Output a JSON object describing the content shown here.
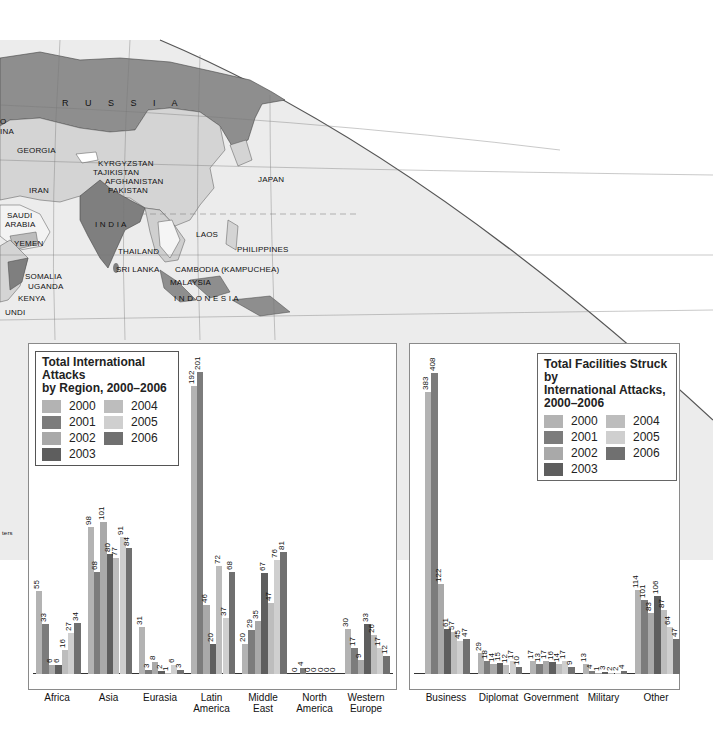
{
  "colors": {
    "2000": "#b3b3b3",
    "2001": "#7c7c7c",
    "2002": "#a9a9a9",
    "2003": "#5e5e5e",
    "2004": "#bdbdbd",
    "2005": "#cfcfcf",
    "2006": "#707070",
    "map_highlight": "#8e8e8e",
    "map_land": "#d7d7d7",
    "map_water": "#ececec"
  },
  "map": {
    "labels": [
      {
        "text": "R U S S I A",
        "x": 62,
        "y": 98,
        "big": true
      },
      {
        "text": "GEORGIA",
        "x": 17,
        "y": 146
      },
      {
        "text": "KYRGYZSTAN",
        "x": 98,
        "y": 159
      },
      {
        "text": "TAJIKISTAN",
        "x": 93,
        "y": 168
      },
      {
        "text": "AFGHANISTAN",
        "x": 105,
        "y": 177
      },
      {
        "text": "PAKISTAN",
        "x": 108,
        "y": 186
      },
      {
        "text": "IRAN",
        "x": 29,
        "y": 186
      },
      {
        "text": "JAPAN",
        "x": 258,
        "y": 175
      },
      {
        "text": "SAUDI",
        "x": 7,
        "y": 211
      },
      {
        "text": "ARABIA",
        "x": 5,
        "y": 220
      },
      {
        "text": "I N D I A",
        "x": 95,
        "y": 220
      },
      {
        "text": "YEMEN",
        "x": 14,
        "y": 239
      },
      {
        "text": "LAOS",
        "x": 196,
        "y": 230
      },
      {
        "text": "THAILAND",
        "x": 118,
        "y": 247
      },
      {
        "text": "PHILIPPINES",
        "x": 237,
        "y": 245
      },
      {
        "text": "SRI LANKA",
        "x": 116,
        "y": 265
      },
      {
        "text": "CAMBODIA (KAMPUCHEA)",
        "x": 175,
        "y": 265
      },
      {
        "text": "SOMALIA",
        "x": 25,
        "y": 272
      },
      {
        "text": "UGANDA",
        "x": 28,
        "y": 282
      },
      {
        "text": "MALAYSIA",
        "x": 170,
        "y": 278
      },
      {
        "text": "KENYA",
        "x": 18,
        "y": 294
      },
      {
        "text": "I N D O N E S I A",
        "x": 174,
        "y": 294
      },
      {
        "text": "UNDI",
        "x": 5,
        "y": 308
      },
      {
        "text": "O",
        "x": 0,
        "y": 117
      },
      {
        "text": "INA",
        "x": 0,
        "y": 127
      }
    ],
    "partial_label": "ters"
  },
  "chart_data": [
    {
      "type": "bar",
      "title": "Total International Attacks by Region, 2000–2006",
      "title_lines": [
        "Total International Attacks",
        "by Region, 2000–2006"
      ],
      "categories": [
        "Africa",
        "Asia",
        "Eurasia",
        "Latin America",
        "Middle East",
        "North America",
        "Western Europe"
      ],
      "category_lines": [
        [
          "Africa"
        ],
        [
          "Asia"
        ],
        [
          "Eurasia"
        ],
        [
          "Latin",
          "America"
        ],
        [
          "Middle",
          "East"
        ],
        [
          "North",
          "America"
        ],
        [
          "Western",
          "Europe"
        ]
      ],
      "legend": [
        "2000",
        "2001",
        "2002",
        "2003",
        "2004",
        "2005",
        "2006"
      ],
      "legend_position": "top-left",
      "series": [
        {
          "name": "2000",
          "values": [
            55,
            98,
            31,
            192,
            20,
            0,
            30
          ]
        },
        {
          "name": "2001",
          "values": [
            33,
            68,
            3,
            201,
            29,
            4,
            17
          ]
        },
        {
          "name": "2002",
          "values": [
            6,
            101,
            8,
            46,
            35,
            0,
            9
          ]
        },
        {
          "name": "2003",
          "values": [
            6,
            80,
            2,
            20,
            67,
            0,
            33
          ]
        },
        {
          "name": "2004",
          "values": [
            16,
            77,
            1,
            72,
            47,
            0,
            26
          ]
        },
        {
          "name": "2005",
          "values": [
            27,
            91,
            6,
            37,
            76,
            0,
            17
          ]
        },
        {
          "name": "2006",
          "values": [
            34,
            84,
            3,
            68,
            81,
            0,
            12
          ]
        }
      ],
      "xlabel": "",
      "ylabel": "",
      "ylim": [
        0,
        205
      ],
      "grid": false
    },
    {
      "type": "bar",
      "title": "Total Facilities Struck by International Attacks, 2000–2006",
      "title_lines": [
        "Total Facilities Struck by",
        "International Attacks,",
        "2000–2006"
      ],
      "categories": [
        "Business",
        "Diplomat",
        "Government",
        "Military",
        "Other"
      ],
      "category_lines": [
        [
          "Business"
        ],
        [
          "Diplomat"
        ],
        [
          "Government"
        ],
        [
          "Military"
        ],
        [
          "Other"
        ]
      ],
      "legend": [
        "2000",
        "2001",
        "2002",
        "2003",
        "2004",
        "2005",
        "2006"
      ],
      "legend_position": "top-right",
      "series": [
        {
          "name": "2000",
          "values": [
            383,
            29,
            17,
            13,
            114
          ]
        },
        {
          "name": "2001",
          "values": [
            408,
            18,
            13,
            4,
            101
          ]
        },
        {
          "name": "2002",
          "values": [
            122,
            14,
            17,
            1,
            83
          ]
        },
        {
          "name": "2003",
          "values": [
            61,
            15,
            16,
            3,
            106
          ]
        },
        {
          "name": "2004",
          "values": [
            57,
            12,
            14,
            2,
            87
          ]
        },
        {
          "name": "2005",
          "values": [
            45,
            17,
            17,
            2,
            64
          ]
        },
        {
          "name": "2006",
          "values": [
            47,
            10,
            9,
            4,
            47
          ]
        }
      ],
      "xlabel": "",
      "ylabel": "",
      "ylim": [
        0,
        415
      ],
      "grid": false
    }
  ]
}
